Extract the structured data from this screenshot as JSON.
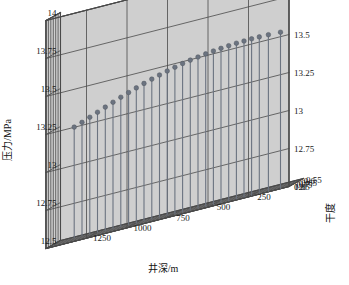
{
  "chart_data": {
    "type": "scatter",
    "render": "3d-stem",
    "title": "",
    "xlabel": "井深/m",
    "ylabel": "干度",
    "zlabel": "压力/MPa",
    "xlim": [
      0,
      1500
    ],
    "ylim": [
      0.5,
      0.8
    ],
    "zlim": [
      12.5,
      14
    ],
    "x_ticks": [
      "1250",
      "1000",
      "750",
      "500",
      "250",
      "0"
    ],
    "x_tick_values": [
      1250,
      1000,
      750,
      500,
      250,
      0
    ],
    "y_ticks": [
      "0.55",
      "0.6",
      "0.65",
      "0.7",
      "0.75",
      "0.8"
    ],
    "y_tick_values": [
      0.55,
      0.6,
      0.65,
      0.7,
      0.75,
      0.8
    ],
    "z_ticks": [
      "12.5",
      "12.75",
      "13",
      "13.25",
      "13.5",
      "13.75",
      "14"
    ],
    "z_tick_values": [
      12.5,
      12.75,
      13,
      13.25,
      13.5,
      13.75,
      14
    ],
    "z_ticks_right": [
      "12.5",
      "12.75",
      "13",
      "13.25",
      "13.5",
      "13.75",
      "14"
    ],
    "grid": true,
    "legend": "none",
    "marker": "filled-circle",
    "marker_color": "#6b7380",
    "stem_color": "#6b7380",
    "pane_color": "#cfcfcf",
    "grid_color": "#4a4a4a",
    "x_axis_direction": "decreasing",
    "points": [
      {
        "x": 1400,
        "y": 0.552,
        "z": 13.228
      },
      {
        "x": 1350,
        "y": 0.558,
        "z": 13.247
      },
      {
        "x": 1300,
        "y": 0.565,
        "z": 13.268
      },
      {
        "x": 1250,
        "y": 0.572,
        "z": 13.289
      },
      {
        "x": 1200,
        "y": 0.579,
        "z": 13.31
      },
      {
        "x": 1150,
        "y": 0.586,
        "z": 13.33
      },
      {
        "x": 1100,
        "y": 0.593,
        "z": 13.35
      },
      {
        "x": 1050,
        "y": 0.6,
        "z": 13.369
      },
      {
        "x": 1000,
        "y": 0.608,
        "z": 13.387
      },
      {
        "x": 950,
        "y": 0.615,
        "z": 13.404
      },
      {
        "x": 900,
        "y": 0.623,
        "z": 13.42
      },
      {
        "x": 850,
        "y": 0.631,
        "z": 13.435
      },
      {
        "x": 800,
        "y": 0.639,
        "z": 13.449
      },
      {
        "x": 750,
        "y": 0.647,
        "z": 13.462
      },
      {
        "x": 700,
        "y": 0.655,
        "z": 13.474
      },
      {
        "x": 650,
        "y": 0.663,
        "z": 13.484
      },
      {
        "x": 600,
        "y": 0.672,
        "z": 13.493
      },
      {
        "x": 550,
        "y": 0.68,
        "z": 13.501
      },
      {
        "x": 500,
        "y": 0.689,
        "z": 13.508
      },
      {
        "x": 450,
        "y": 0.698,
        "z": 13.514
      },
      {
        "x": 400,
        "y": 0.707,
        "z": 13.519
      },
      {
        "x": 350,
        "y": 0.716,
        "z": 13.523
      },
      {
        "x": 300,
        "y": 0.726,
        "z": 13.526
      },
      {
        "x": 250,
        "y": 0.735,
        "z": 13.528
      },
      {
        "x": 200,
        "y": 0.745,
        "z": 13.529
      },
      {
        "x": 140,
        "y": 0.757,
        "z": 13.529
      },
      {
        "x": 60,
        "y": 0.775,
        "z": 13.527
      }
    ]
  }
}
